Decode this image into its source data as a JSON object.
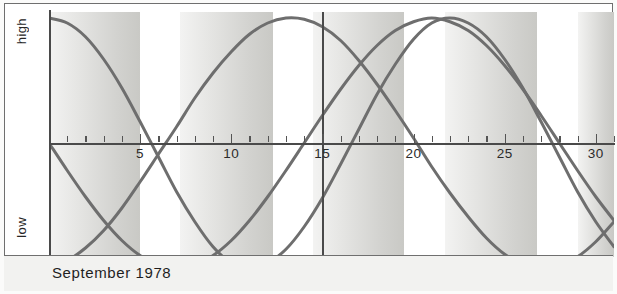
{
  "caption": {
    "text": "September 1978"
  },
  "axis": {
    "y_top_label": "high",
    "y_bottom_label": "low",
    "tick_labels": [
      "5",
      "10",
      "15",
      "20",
      "25",
      "30"
    ]
  },
  "chart_data": {
    "type": "line",
    "title": "September 1978",
    "xlabel": "",
    "ylabel": "",
    "xlim": [
      0,
      31
    ],
    "ylim": [
      -1,
      1
    ],
    "grid": false,
    "legend": false,
    "x_tick_values": [
      5,
      10,
      15,
      20,
      25,
      30
    ],
    "x_tick_labels": [
      "5",
      "10",
      "15",
      "20",
      "25",
      "30"
    ],
    "y_tick_labels": [
      "high",
      "low"
    ],
    "annotations": [
      {
        "name": "today-marker",
        "type": "vline",
        "x": 15
      }
    ],
    "shaded_bands": [
      {
        "x_start": 0.0,
        "x_end": 5.0
      },
      {
        "x_start": 7.2,
        "x_end": 12.3
      },
      {
        "x_start": 14.5,
        "x_end": 19.5
      },
      {
        "x_start": 21.7,
        "x_end": 26.8
      },
      {
        "x_start": 29.0,
        "x_end": 31.0
      }
    ],
    "series": [
      {
        "name": "physical",
        "period_days": 23,
        "phase_start": "peak",
        "color": "#6e6e6e",
        "x": [
          0,
          1,
          2,
          3,
          4,
          5,
          6,
          7,
          8,
          9,
          10,
          11,
          12,
          13,
          14,
          15,
          16,
          17,
          18,
          19,
          20,
          21,
          22,
          23,
          24,
          25,
          26,
          27,
          28,
          29,
          30,
          31
        ],
        "values": [
          1.0,
          0.96,
          0.85,
          0.67,
          0.44,
          0.17,
          -0.11,
          -0.39,
          -0.63,
          -0.83,
          -0.96,
          -1.0,
          -0.96,
          -0.85,
          -0.67,
          -0.44,
          -0.17,
          0.11,
          0.39,
          0.63,
          0.83,
          0.96,
          1.0,
          0.96,
          0.85,
          0.67,
          0.44,
          0.17,
          -0.11,
          -0.39,
          -0.63,
          -0.83
        ]
      },
      {
        "name": "emotional",
        "period_days": 28,
        "phase_start": "zero-falling",
        "color": "#6e6e6e",
        "x": [
          0,
          1,
          2,
          3,
          4,
          5,
          6,
          7,
          8,
          9,
          10,
          11,
          12,
          13,
          14,
          15,
          16,
          17,
          18,
          19,
          20,
          21,
          22,
          23,
          24,
          25,
          26,
          27,
          28,
          29,
          30,
          31
        ],
        "values": [
          0.0,
          -0.22,
          -0.43,
          -0.62,
          -0.78,
          -0.9,
          -0.97,
          -1.0,
          -0.97,
          -0.9,
          -0.78,
          -0.62,
          -0.43,
          -0.22,
          0.0,
          0.22,
          0.43,
          0.62,
          0.78,
          0.9,
          0.97,
          1.0,
          0.97,
          0.9,
          0.78,
          0.62,
          0.43,
          0.22,
          0.0,
          -0.22,
          -0.43,
          -0.62
        ]
      },
      {
        "name": "intellectual",
        "period_days": 33,
        "phase_start": "trough",
        "color": "#6e6e6e",
        "x": [
          0,
          1,
          2,
          3,
          4,
          5,
          6,
          7,
          8,
          9,
          10,
          11,
          12,
          13,
          14,
          15,
          16,
          17,
          18,
          19,
          20,
          21,
          22,
          23,
          24,
          25,
          26,
          27,
          28,
          29,
          30,
          31
        ],
        "values": [
          -0.98,
          -0.94,
          -0.84,
          -0.7,
          -0.52,
          -0.31,
          -0.09,
          0.13,
          0.36,
          0.56,
          0.73,
          0.87,
          0.96,
          1.0,
          0.99,
          0.93,
          0.82,
          0.66,
          0.47,
          0.26,
          0.04,
          -0.19,
          -0.4,
          -0.59,
          -0.76,
          -0.89,
          -0.97,
          -1.0,
          -0.98,
          -0.91,
          -0.79,
          -0.63
        ]
      }
    ]
  }
}
